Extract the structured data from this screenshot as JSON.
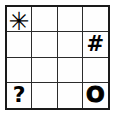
{
  "figure": {
    "kind": "symbol-grid",
    "rows": 4,
    "columns": 4,
    "border_color": "#1a1a1a",
    "gridline_color": "#2b2b2b",
    "cell_background": "#fefefe",
    "glyph_color": "#000000"
  },
  "grid": {
    "cells": [
      {
        "row": 1,
        "col": 1,
        "symbol": "✳",
        "name": "asterisk",
        "style": "sym-asterisk"
      },
      {
        "row": 1,
        "col": 2,
        "symbol": "",
        "name": "empty",
        "style": "sym-empty"
      },
      {
        "row": 1,
        "col": 3,
        "symbol": "",
        "name": "empty",
        "style": "sym-empty"
      },
      {
        "row": 1,
        "col": 4,
        "symbol": "",
        "name": "empty",
        "style": "sym-empty"
      },
      {
        "row": 2,
        "col": 1,
        "symbol": "",
        "name": "empty",
        "style": "sym-empty"
      },
      {
        "row": 2,
        "col": 2,
        "symbol": "",
        "name": "empty",
        "style": "sym-empty"
      },
      {
        "row": 2,
        "col": 3,
        "symbol": "",
        "name": "empty",
        "style": "sym-empty"
      },
      {
        "row": 2,
        "col": 4,
        "symbol": "#",
        "name": "hash",
        "style": "sym-hash"
      },
      {
        "row": 3,
        "col": 1,
        "symbol": "",
        "name": "empty",
        "style": "sym-empty"
      },
      {
        "row": 3,
        "col": 2,
        "symbol": "",
        "name": "empty",
        "style": "sym-empty"
      },
      {
        "row": 3,
        "col": 3,
        "symbol": "",
        "name": "empty",
        "style": "sym-empty"
      },
      {
        "row": 3,
        "col": 4,
        "symbol": "",
        "name": "empty",
        "style": "sym-empty"
      },
      {
        "row": 4,
        "col": 1,
        "symbol": "?",
        "name": "question",
        "style": "sym-question"
      },
      {
        "row": 4,
        "col": 2,
        "symbol": "",
        "name": "empty",
        "style": "sym-empty"
      },
      {
        "row": 4,
        "col": 3,
        "symbol": "",
        "name": "empty",
        "style": "sym-empty"
      },
      {
        "row": 4,
        "col": 4,
        "symbol": "O",
        "name": "letter-o",
        "style": "sym-letter-o"
      }
    ]
  }
}
